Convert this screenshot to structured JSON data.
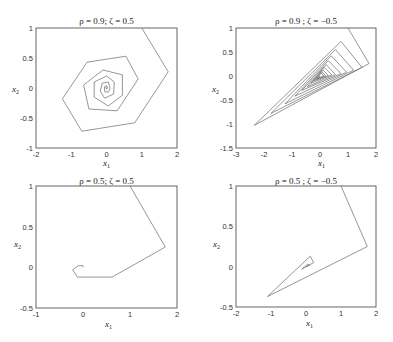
{
  "chart_data": [
    {
      "type": "line",
      "title": "ρ = 0.9;  ζ = 0.5",
      "xlabel": "x1",
      "ylabel": "x2",
      "xlim": [
        -2,
        2
      ],
      "ylim": [
        -1,
        1
      ],
      "xticks": [
        -2,
        -1,
        0,
        1,
        2
      ],
      "yticks": [
        -1,
        -0.5,
        0,
        0.5,
        1
      ],
      "grid": false,
      "series": [
        {
          "name": "trajectory",
          "points": [
            [
              1.0,
              1.0
            ],
            [
              1.75,
              0.27
            ],
            [
              0.8,
              -0.58
            ],
            [
              -0.7,
              -0.72
            ],
            [
              -1.25,
              -0.18
            ],
            [
              -0.55,
              0.43
            ],
            [
              0.55,
              0.53
            ],
            [
              0.9,
              0.15
            ],
            [
              0.3,
              -0.38
            ],
            [
              -0.5,
              -0.35
            ],
            [
              -0.65,
              0.05
            ],
            [
              -0.1,
              0.3
            ],
            [
              0.45,
              0.22
            ],
            [
              0.45,
              -0.12
            ],
            [
              0.05,
              -0.3
            ],
            [
              -0.35,
              -0.15
            ],
            [
              -0.35,
              0.1
            ],
            [
              0.0,
              0.2
            ],
            [
              0.22,
              0.1
            ],
            [
              0.2,
              -0.1
            ],
            [
              -0.05,
              -0.17
            ],
            [
              -0.18,
              -0.05
            ],
            [
              -0.12,
              0.08
            ],
            [
              0.05,
              0.1
            ],
            [
              0.1,
              0.0
            ],
            [
              0.05,
              -0.07
            ],
            [
              -0.05,
              -0.06
            ],
            [
              -0.06,
              0.02
            ],
            [
              0.0,
              0.04
            ],
            [
              0.03,
              0.0
            ],
            [
              0.0,
              -0.02
            ],
            [
              -0.01,
              0.01
            ],
            [
              0.0,
              0.0
            ]
          ]
        }
      ]
    },
    {
      "type": "line",
      "title": "ρ = 0.9 ; ζ = −0.5",
      "xlabel": "x1",
      "ylabel": "x2",
      "xlim": [
        -3,
        2
      ],
      "ylim": [
        -1.5,
        1
      ],
      "xticks": [
        -3,
        -2,
        -1,
        0,
        1,
        2
      ],
      "yticks": [
        -1.5,
        -1,
        -0.5,
        0,
        0.5,
        1
      ],
      "grid": false,
      "series": [
        {
          "name": "trajectory",
          "points": [
            [
              1.0,
              1.0
            ],
            [
              1.75,
              0.26
            ],
            [
              -2.35,
              -1.03
            ],
            [
              0.75,
              0.72
            ],
            [
              1.5,
              0.18
            ],
            [
              -1.75,
              -0.78
            ],
            [
              0.55,
              0.55
            ],
            [
              1.2,
              0.12
            ],
            [
              -1.25,
              -0.58
            ],
            [
              0.4,
              0.42
            ],
            [
              0.95,
              0.08
            ],
            [
              -0.9,
              -0.42
            ],
            [
              0.3,
              0.32
            ],
            [
              0.75,
              0.05
            ],
            [
              -0.65,
              -0.3
            ],
            [
              0.22,
              0.24
            ],
            [
              0.55,
              0.03
            ],
            [
              -0.45,
              -0.22
            ],
            [
              0.15,
              0.18
            ],
            [
              0.42,
              0.02
            ],
            [
              -0.32,
              -0.15
            ],
            [
              0.1,
              0.13
            ],
            [
              0.3,
              0.01
            ],
            [
              -0.22,
              -0.1
            ],
            [
              0.07,
              0.09
            ],
            [
              0.2,
              0.0
            ],
            [
              -0.15,
              -0.07
            ],
            [
              0.05,
              0.06
            ],
            [
              0.13,
              0.0
            ],
            [
              -0.1,
              -0.05
            ],
            [
              0.0,
              0.0
            ]
          ]
        }
      ]
    },
    {
      "type": "line",
      "title": "ρ = 0.5;  ζ = 0.5",
      "xlabel": "x1",
      "ylabel": "x2",
      "xlim": [
        -1,
        2
      ],
      "ylim": [
        -0.5,
        1
      ],
      "xticks": [
        -1,
        0,
        1,
        2
      ],
      "yticks": [
        -0.5,
        0,
        0.5,
        1
      ],
      "grid": false,
      "series": [
        {
          "name": "trajectory",
          "points": [
            [
              1.0,
              1.0
            ],
            [
              1.75,
              0.25
            ],
            [
              0.62,
              -0.12
            ],
            [
              -0.12,
              -0.12
            ],
            [
              -0.22,
              -0.03
            ],
            [
              -0.1,
              0.02
            ],
            [
              0.0,
              0.02
            ],
            [
              0.0,
              0.0
            ]
          ]
        }
      ]
    },
    {
      "type": "line",
      "title": "ρ = 0.5 ; ζ = −0.5",
      "xlabel": "x1",
      "ylabel": "x2",
      "xlim": [
        -2,
        2
      ],
      "ylim": [
        -0.5,
        1
      ],
      "xticks": [
        -2,
        -1,
        0,
        1,
        2
      ],
      "yticks": [
        -0.5,
        0,
        0.5,
        1
      ],
      "grid": false,
      "series": [
        {
          "name": "trajectory",
          "points": [
            [
              1.0,
              1.0
            ],
            [
              1.75,
              0.25
            ],
            [
              -1.1,
              -0.37
            ],
            [
              0.12,
              0.13
            ],
            [
              0.22,
              0.05
            ],
            [
              -0.12,
              -0.03
            ],
            [
              0.05,
              0.03
            ],
            [
              0.1,
              0.02
            ],
            [
              0.0,
              0.0
            ]
          ]
        }
      ]
    }
  ]
}
